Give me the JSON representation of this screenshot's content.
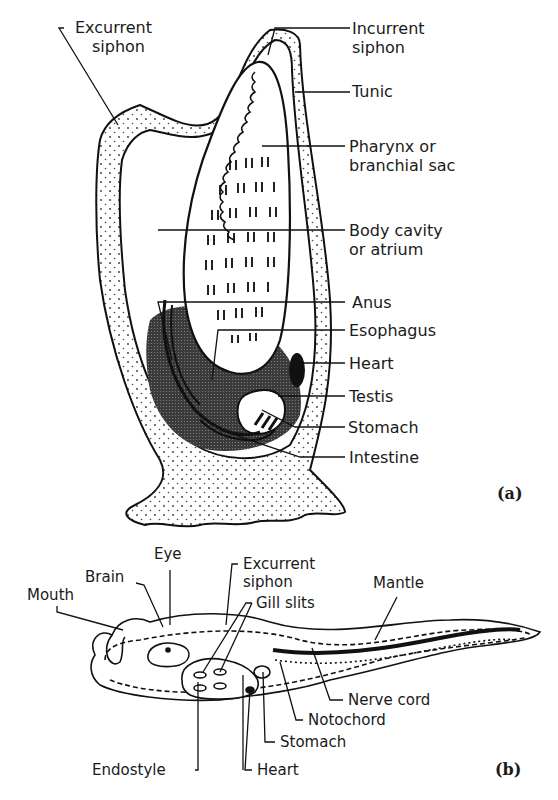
{
  "figure_a": {
    "panel_label": "(a)",
    "labels": {
      "excurrent_siphon_1": "Excurrent",
      "excurrent_siphon_2": "siphon",
      "incurrent_siphon_1": "Incurrent",
      "incurrent_siphon_2": "siphon",
      "tunic": "Tunic",
      "pharynx_1": "Pharynx or",
      "pharynx_2": "branchial sac",
      "body_cavity_1": "Body cavity",
      "body_cavity_2": "or atrium",
      "anus": "Anus",
      "esophagus": "Esophagus",
      "heart": "Heart",
      "testis": "Testis",
      "stomach": "Stomach",
      "intestine": "Intestine"
    }
  },
  "figure_b": {
    "panel_label": "(b)",
    "labels": {
      "eye": "Eye",
      "brain": "Brain",
      "mouth": "Mouth",
      "excurrent_siphon_1": "Excurrent",
      "excurrent_siphon_2": "siphon",
      "gill_slits": "Gill slits",
      "mantle": "Mantle",
      "nerve_cord": "Nerve cord",
      "notochord": "Notochord",
      "stomach": "Stomach",
      "endostyle": "Endostyle",
      "heart": "Heart"
    }
  }
}
